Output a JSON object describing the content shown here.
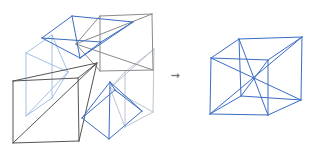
{
  "arrow": {
    "glyph": "⇝"
  },
  "colors": {
    "blue": "#3a6cc4",
    "light_blue": "#a5c2e4",
    "silver": "#bdc5d1",
    "gray": "#8a8a8a",
    "dark_gray": "#555555",
    "arrow_gray": "#666666"
  },
  "figures": [
    {
      "name": "left-exploded-cube",
      "groups": [
        {
          "name": "right-face-pyramid",
          "color": "silver",
          "segments": [
            [
              125,
              72,
              154,
              49
            ],
            [
              154,
              49,
              153,
              112
            ],
            [
              153,
              112,
              125,
              127
            ],
            [
              125,
              127,
              125,
              72
            ],
            [
              125,
              72,
              110,
              88
            ],
            [
              154,
              49,
              110,
              88
            ],
            [
              153,
              112,
              110,
              88
            ],
            [
              125,
              127,
              110,
              88
            ]
          ]
        },
        {
          "name": "left-face-pyramid",
          "color": "light_blue",
          "segments": [
            [
              26,
              53,
              52,
              35
            ],
            [
              52,
              35,
              52,
              98
            ],
            [
              52,
              98,
              26,
              116
            ],
            [
              26,
              116,
              26,
              53
            ],
            [
              26,
              53,
              68,
              72
            ],
            [
              52,
              35,
              68,
              72
            ],
            [
              52,
              98,
              68,
              72
            ],
            [
              26,
              116,
              68,
              72
            ]
          ]
        },
        {
          "name": "back-face-pyramid",
          "color": "gray",
          "segments": [
            [
              100,
              16,
              152,
              14
            ],
            [
              152,
              14,
              153,
              70
            ],
            [
              153,
              70,
              100,
              71
            ],
            [
              100,
              71,
              100,
              16
            ],
            [
              100,
              16,
              76,
              44
            ],
            [
              152,
              14,
              76,
              44
            ],
            [
              153,
              70,
              76,
              44
            ],
            [
              100,
              71,
              76,
              44
            ]
          ]
        },
        {
          "name": "front-face-pyramid",
          "color": "dark_gray",
          "segments": [
            [
              13,
              81,
              78,
              78
            ],
            [
              78,
              78,
              79,
              141
            ],
            [
              79,
              141,
              13,
              143
            ],
            [
              13,
              143,
              13,
              81
            ],
            [
              13,
              81,
              97,
              63
            ],
            [
              78,
              78,
              97,
              63
            ],
            [
              79,
              141,
              97,
              63
            ],
            [
              13,
              143,
              97,
              63
            ]
          ]
        },
        {
          "name": "top-face-pyramid",
          "color": "blue",
          "segments": [
            [
              42,
              38,
              72,
              16
            ],
            [
              72,
              16,
              133,
              22
            ],
            [
              133,
              22,
              101,
              42
            ],
            [
              101,
              42,
              42,
              38
            ],
            [
              42,
              38,
              80,
              58
            ],
            [
              72,
              16,
              80,
              58
            ],
            [
              133,
              22,
              80,
              58
            ],
            [
              101,
              42,
              80,
              58
            ]
          ]
        },
        {
          "name": "bottom-face-pyramid",
          "color": "blue",
          "segments": [
            [
              82,
              118,
              109,
              139
            ],
            [
              109,
              139,
              142,
              111
            ],
            [
              142,
              111,
              115,
              90
            ],
            [
              115,
              90,
              82,
              118
            ],
            [
              82,
              118,
              110,
              82
            ],
            [
              109,
              139,
              110,
              82
            ],
            [
              142,
              111,
              110,
              82
            ],
            [
              115,
              90,
              110,
              82
            ]
          ]
        }
      ]
    },
    {
      "name": "right-cube-with-center-cone",
      "groups": [
        {
          "name": "cube-edges",
          "color": "blue",
          "segments": [
            [
              211,
              58,
              268,
              60
            ],
            [
              268,
              60,
              268,
              115
            ],
            [
              268,
              115,
              210,
              114
            ],
            [
              210,
              114,
              211,
              58
            ],
            [
              239,
              39,
              302,
              37
            ],
            [
              302,
              37,
              301,
              100
            ],
            [
              301,
              100,
              241,
              96
            ],
            [
              241,
              96,
              239,
              39
            ],
            [
              211,
              58,
              239,
              39
            ],
            [
              268,
              60,
              302,
              37
            ],
            [
              268,
              115,
              301,
              100
            ],
            [
              210,
              114,
              241,
              96
            ]
          ]
        },
        {
          "name": "space-diagonals",
          "color": "blue",
          "segments": [
            [
              239,
              39,
              268,
              115
            ],
            [
              302,
              37,
              210,
              114
            ],
            [
              211,
              58,
              301,
              100
            ],
            [
              268,
              60,
              241,
              96
            ]
          ]
        }
      ]
    }
  ]
}
